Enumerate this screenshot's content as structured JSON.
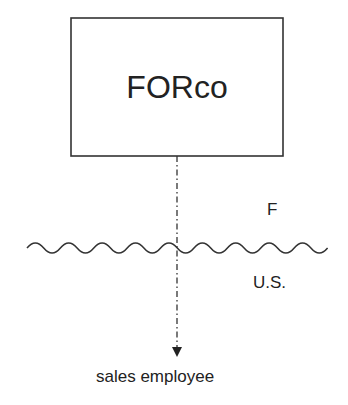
{
  "diagram": {
    "box": {
      "label": "FORco"
    },
    "border": {
      "upper_label": "F",
      "lower_label": "U.S."
    },
    "target": {
      "label": "sales employee"
    },
    "colors": {
      "stroke": "#333333",
      "background": "#ffffff"
    }
  }
}
